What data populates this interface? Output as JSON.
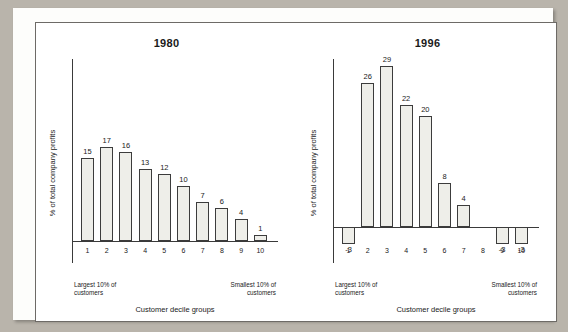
{
  "chart_data": [
    {
      "type": "bar",
      "title": "1980",
      "xlabel": "Customer decile groups",
      "ylabel": "% of total company profits",
      "categories": [
        "1",
        "2",
        "3",
        "4",
        "5",
        "6",
        "7",
        "8",
        "9",
        "10"
      ],
      "values": [
        15,
        17,
        16,
        13,
        12,
        10,
        7,
        6,
        4,
        1
      ],
      "ylim": [
        -4,
        32
      ],
      "grid": false,
      "legend": null,
      "annotations": {
        "left_note": "Largest 10% of customers",
        "right_note": "Smallest 10% of customers"
      },
      "bar_fill": "#eeeee9",
      "bar_stroke": "#3c3c3c"
    },
    {
      "type": "bar",
      "title": "1996",
      "xlabel": "Customer decile groups",
      "ylabel": "% of total company profits",
      "categories": [
        "1",
        "2",
        "3",
        "4",
        "5",
        "6",
        "7",
        "8",
        "9",
        "10"
      ],
      "values": [
        -3,
        26,
        29,
        22,
        20,
        8,
        4,
        0,
        -3,
        -3
      ],
      "value_labels": [
        "-3",
        "26",
        "29",
        "22",
        "20",
        "8",
        "4",
        "",
        "-3",
        "-3"
      ],
      "ylim": [
        -4,
        32
      ],
      "grid": false,
      "legend": null,
      "annotations": {
        "left_note": "Largest 10% of customers",
        "right_note": "Smallest 10% of customers"
      },
      "bar_fill": "#eeeee9",
      "bar_stroke": "#3c3c3c"
    }
  ],
  "panels": [
    {
      "title": "1980",
      "ylabel": "% of total company profits",
      "xlabel": "Customer decile groups",
      "left_note": "Largest 10% of customers",
      "right_note": "Smallest 10% of customers"
    },
    {
      "title": "1996",
      "ylabel": "% of total company profits",
      "xlabel": "Customer decile groups",
      "left_note": "Largest 10% of customers",
      "right_note": "Smallest 10% of customers"
    }
  ]
}
